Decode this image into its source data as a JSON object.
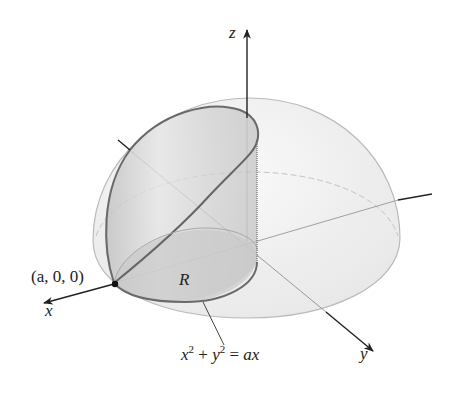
{
  "figure": {
    "colors": {
      "axis": "#222222",
      "dome_fill": "#eeeeee",
      "dome_outline": "#b5b5b5",
      "cylinder_fill": "#c8c8c8",
      "cylinder_outline": "#6e6e6e",
      "region_fill": "#d2d2d2",
      "point": "#111111"
    }
  },
  "labels": {
    "z_axis": "z",
    "x_axis": "x",
    "y_axis": "y",
    "point": "(a, 0, 0)",
    "region": "R",
    "equation": {
      "x": "x",
      "x_exp": "2",
      "plus": " + ",
      "y": "y",
      "y_exp": "2",
      "eq": " = ",
      "rhs": "ax"
    }
  }
}
